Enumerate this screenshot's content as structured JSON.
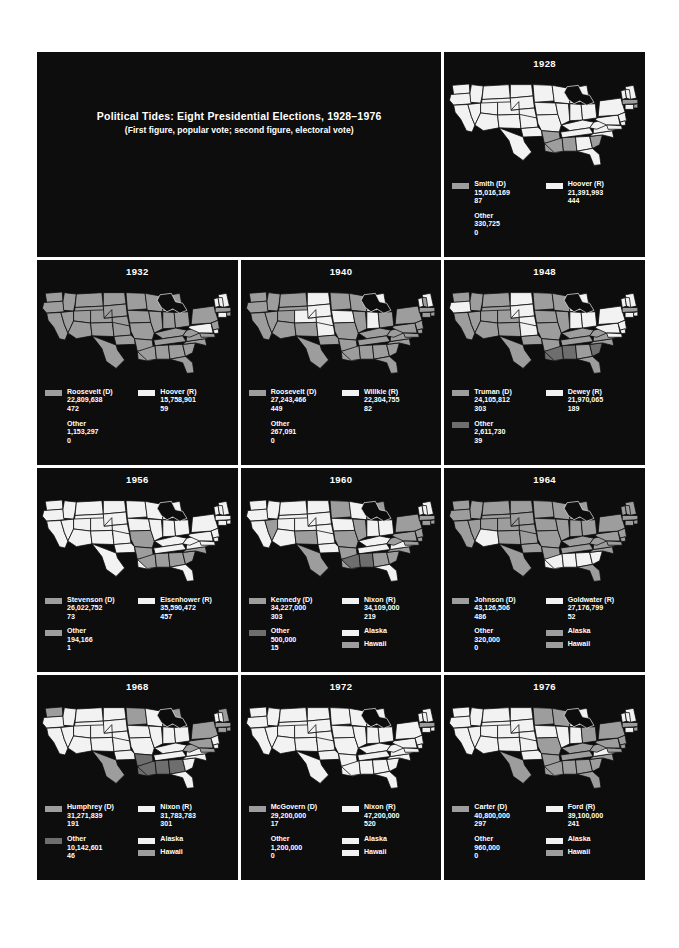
{
  "title": {
    "main": "Political Tides: Eight Presidential Elections, 1928–1976",
    "sub": "(First figure, popular vote; second figure, electoral vote)"
  },
  "colors": {
    "panel_background": "#0d0d0d",
    "page_background": "#ffffff",
    "text": "#ffffff",
    "swatch_white": "#f2f2f2",
    "swatch_gray": "#9d9d9d",
    "swatch_dark": "#6e6e6e"
  },
  "chart_data": {
    "type": "map",
    "title": "Political Tides: Eight Presidential Elections, 1928–1976",
    "subtitle": "(First figure, popular vote; second figure, electoral vote)",
    "note": "Choropleth series of U.S. state maps; fill tone encodes winning party per state.",
    "series": [
      {
        "year": "1928",
        "democrat": {
          "name": "Smith (D)",
          "popular_vote": "15,016,169",
          "electoral_vote": "87",
          "swatch": "gray"
        },
        "republican": {
          "name": "Hoover (R)",
          "popular_vote": "21,391,993",
          "electoral_vote": "444",
          "swatch": "white"
        },
        "other": {
          "name": "Other",
          "popular_vote": "330,725",
          "electoral_vote": "0",
          "swatch": "none"
        },
        "alaska": null,
        "hawaii": null,
        "dem_states": [
          "AL",
          "MS",
          "LA",
          "AR",
          "SC",
          "MA",
          "RI"
        ],
        "other_states": []
      },
      {
        "year": "1932",
        "democrat": {
          "name": "Roosevelt (D)",
          "popular_vote": "22,809,638",
          "electoral_vote": "472",
          "swatch": "gray"
        },
        "republican": {
          "name": "Hoover (R)",
          "popular_vote": "15,758,901",
          "electoral_vote": "59",
          "swatch": "white"
        },
        "other": {
          "name": "Other",
          "popular_vote": "1,153,297",
          "electoral_vote": "0",
          "swatch": "none"
        },
        "alaska": null,
        "hawaii": null,
        "rep_states": [
          "ME",
          "NH",
          "VT",
          "CT",
          "DE",
          "PA"
        ],
        "other_states": []
      },
      {
        "year": "1940",
        "democrat": {
          "name": "Roosevelt (D)",
          "popular_vote": "27,243,466",
          "electoral_vote": "449",
          "swatch": "gray"
        },
        "republican": {
          "name": "Willkie (R)",
          "popular_vote": "22,304,755",
          "electoral_vote": "82",
          "swatch": "white"
        },
        "other": {
          "name": "Other",
          "popular_vote": "267,091",
          "electoral_vote": "0",
          "swatch": "none"
        },
        "alaska": null,
        "hawaii": null,
        "rep_states": [
          "ME",
          "VT",
          "MI",
          "IN",
          "IA",
          "NE",
          "SD",
          "ND",
          "KS",
          "CO"
        ],
        "other_states": []
      },
      {
        "year": "1948",
        "democrat": {
          "name": "Truman (D)",
          "popular_vote": "24,105,812",
          "electoral_vote": "303",
          "swatch": "gray"
        },
        "republican": {
          "name": "Dewey (R)",
          "popular_vote": "21,970,065",
          "electoral_vote": "189",
          "swatch": "white"
        },
        "other": {
          "name": "Other",
          "popular_vote": "2,611,730",
          "electoral_vote": "39",
          "swatch": "dark"
        },
        "alaska": null,
        "hawaii": null,
        "rep_states": [
          "ME",
          "NH",
          "VT",
          "NY",
          "NJ",
          "PA",
          "DE",
          "MD",
          "CT",
          "RI",
          "MI",
          "IN",
          "OH",
          "ND",
          "SD",
          "NE",
          "KS",
          "OR"
        ],
        "other_states": [
          "SC",
          "AL",
          "MS",
          "LA"
        ]
      },
      {
        "year": "1956",
        "democrat": {
          "name": "Stevenson (D)",
          "popular_vote": "26,022,752",
          "electoral_vote": "73",
          "swatch": "gray"
        },
        "republican": {
          "name": "Eisenhower (R)",
          "popular_vote": "35,590,472",
          "electoral_vote": "457",
          "swatch": "white"
        },
        "other": {
          "name": "Other",
          "popular_vote": "194,166",
          "electoral_vote": "1",
          "swatch": "gray"
        },
        "alaska": null,
        "hawaii": null,
        "dem_states": [
          "MO",
          "AR",
          "MS",
          "AL",
          "GA",
          "NC",
          "SC"
        ],
        "other_states": []
      },
      {
        "year": "1960",
        "democrat": {
          "name": "Kennedy (D)",
          "popular_vote": "34,227,000",
          "electoral_vote": "303",
          "swatch": "gray"
        },
        "republican": {
          "name": "Nixon (R)",
          "popular_vote": "34,109,000",
          "electoral_vote": "219",
          "swatch": "white"
        },
        "other": {
          "name": "Other",
          "popular_vote": "500,000",
          "electoral_vote": "15",
          "swatch": "dark"
        },
        "alaska": {
          "label": "Alaska",
          "swatch": "white"
        },
        "hawaii": {
          "label": "Hawaii",
          "swatch": "gray"
        },
        "dem_states": [
          "NV",
          "NM",
          "TX",
          "LA",
          "AR",
          "MO",
          "IL",
          "MI",
          "NY",
          "PA",
          "NJ",
          "CT",
          "RI",
          "MA",
          "NC",
          "SC",
          "GA",
          "WV",
          "MD",
          "DE",
          "MN"
        ],
        "other_states": [
          "MS",
          "AL"
        ]
      },
      {
        "year": "1964",
        "democrat": {
          "name": "Johnson (D)",
          "popular_vote": "43,126,506",
          "electoral_vote": "486",
          "swatch": "gray"
        },
        "republican": {
          "name": "Goldwater (R)",
          "popular_vote": "27,176,799",
          "electoral_vote": "52",
          "swatch": "white"
        },
        "other": {
          "name": "Other",
          "popular_vote": "320,000",
          "electoral_vote": "0",
          "swatch": "none"
        },
        "alaska": {
          "label": "Alaska",
          "swatch": "gray"
        },
        "hawaii": {
          "label": "Hawaii",
          "swatch": "gray"
        },
        "rep_states": [
          "AZ",
          "LA",
          "MS",
          "AL",
          "GA",
          "SC"
        ],
        "other_states": []
      },
      {
        "year": "1968",
        "democrat": {
          "name": "Humphrey (D)",
          "popular_vote": "31,271,839",
          "electoral_vote": "191",
          "swatch": "gray"
        },
        "republican": {
          "name": "Nixon (R)",
          "popular_vote": "31,783,783",
          "electoral_vote": "301",
          "swatch": "white"
        },
        "other": {
          "name": "Other",
          "popular_vote": "10,142,601",
          "electoral_vote": "46",
          "swatch": "dark"
        },
        "alaska": {
          "label": "Alaska",
          "swatch": "white"
        },
        "hawaii": {
          "label": "Hawaii",
          "swatch": "gray"
        },
        "dem_states": [
          "WA",
          "MN",
          "MI",
          "PA",
          "NY",
          "CT",
          "RI",
          "MA",
          "ME",
          "WV",
          "MD",
          "TX",
          "HI"
        ],
        "other_states": [
          "AR",
          "LA",
          "MS",
          "AL",
          "GA"
        ]
      },
      {
        "year": "1972",
        "democrat": {
          "name": "McGovern (D)",
          "popular_vote": "29,200,000",
          "electoral_vote": "17",
          "swatch": "gray"
        },
        "republican": {
          "name": "Nixon (R)",
          "popular_vote": "47,200,000",
          "electoral_vote": "520",
          "swatch": "white"
        },
        "other": {
          "name": "Other",
          "popular_vote": "1,200,000",
          "electoral_vote": "0",
          "swatch": "none"
        },
        "alaska": {
          "label": "Alaska",
          "swatch": "white"
        },
        "hawaii": {
          "label": "Hawaii",
          "swatch": "white"
        },
        "dem_states": [
          "MA"
        ],
        "other_states": []
      },
      {
        "year": "1976",
        "democrat": {
          "name": "Carter (D)",
          "popular_vote": "40,800,000",
          "electoral_vote": "297",
          "swatch": "gray"
        },
        "republican": {
          "name": "Ford (R)",
          "popular_vote": "39,100,000",
          "electoral_vote": "241",
          "swatch": "white"
        },
        "other": {
          "name": "Other",
          "popular_vote": "960,000",
          "electoral_vote": "0",
          "swatch": "none"
        },
        "alaska": {
          "label": "Alaska",
          "swatch": "white"
        },
        "hawaii": {
          "label": "Hawaii",
          "swatch": "gray"
        },
        "dem_states": [
          "TX",
          "LA",
          "AR",
          "MS",
          "AL",
          "GA",
          "FL",
          "SC",
          "NC",
          "TN",
          "KY",
          "MO",
          "MN",
          "WI",
          "OH",
          "PA",
          "NY",
          "MD",
          "DE",
          "WV",
          "RI",
          "MA",
          "NJ",
          "HI"
        ],
        "other_states": []
      }
    ]
  }
}
